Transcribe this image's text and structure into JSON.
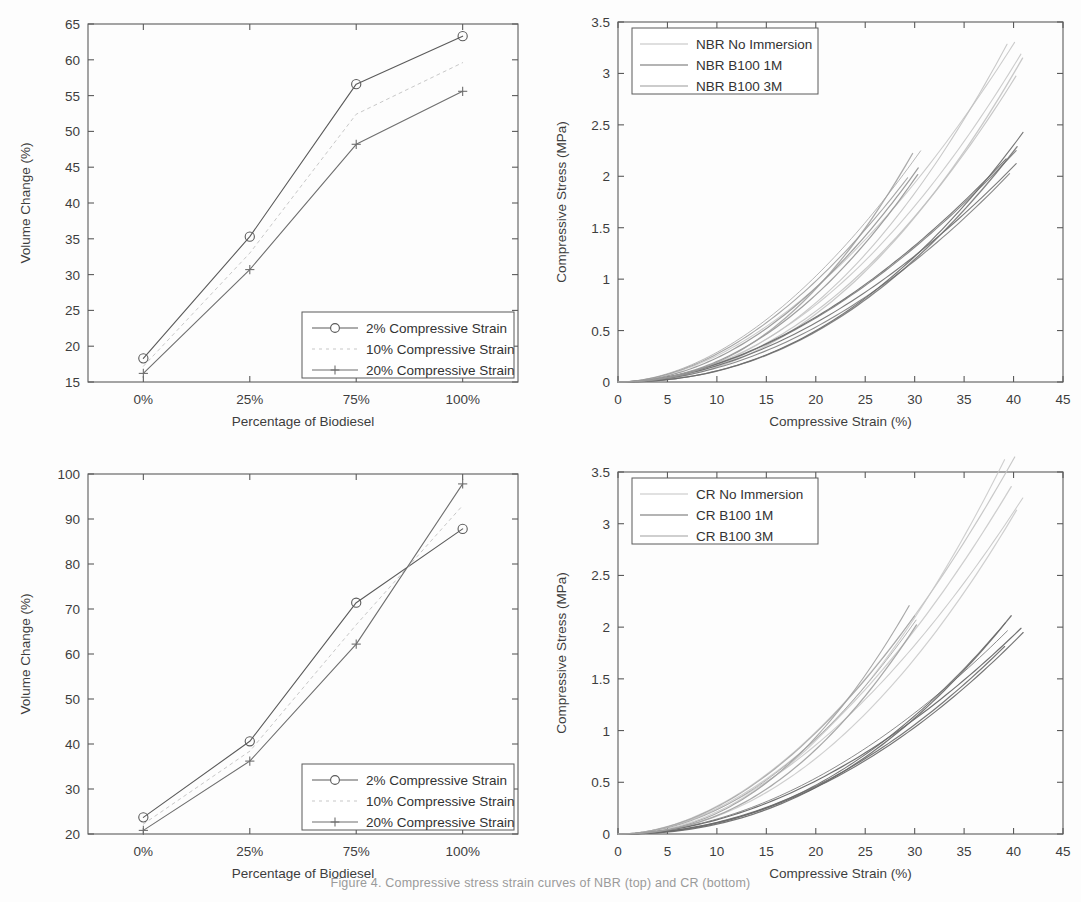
{
  "figure": {
    "caption_fragment": "Figure 4. Compressive stress strain curves of NBR (top) and CR (bottom)"
  },
  "chart_data": [
    {
      "panel": "top-left",
      "type": "line",
      "title": "",
      "xlabel": "Percentage of Biodiesel",
      "ylabel": "Volume Change (%)",
      "categories": [
        "0%",
        "25%",
        "75%",
        "100%"
      ],
      "xlim": [
        -0.35,
        3.35
      ],
      "ylim": [
        15,
        65
      ],
      "yticks": [
        15,
        20,
        25,
        30,
        35,
        40,
        45,
        50,
        55,
        60,
        65
      ],
      "grid": false,
      "legend_position": "lower-right",
      "series": [
        {
          "name": "2% Compressive Strain",
          "marker": "circle",
          "color": "#5a5a5a",
          "values": [
            18.3,
            35.3,
            56.6,
            63.3
          ]
        },
        {
          "name": "10% Compressive Strain",
          "marker": "none",
          "color": "#c8c8c8",
          "values": [
            17.2,
            33.0,
            52.4,
            59.6
          ]
        },
        {
          "name": "20% Compressive Strain",
          "marker": "plus",
          "color": "#6e6e6e",
          "values": [
            16.2,
            30.7,
            48.2,
            55.6
          ]
        }
      ]
    },
    {
      "panel": "top-right",
      "type": "line",
      "title": "",
      "xlabel": "Compressive Strain (%)",
      "ylabel": "Compressive Stress (MPa)",
      "xlim": [
        0,
        45
      ],
      "ylim": [
        0,
        3.5
      ],
      "xticks": [
        0,
        5,
        10,
        15,
        20,
        25,
        30,
        35,
        40,
        45
      ],
      "yticks": [
        0,
        0.5,
        1,
        1.5,
        2,
        2.5,
        3,
        3.5
      ],
      "grid": false,
      "legend_position": "upper-left",
      "series": [
        {
          "name": "NBR No Immersion",
          "color": "#c0c0c0",
          "peak_strain": 40,
          "peak_stress": 3.2,
          "count": 5
        },
        {
          "name": "NBR B100 1M",
          "color": "#6a6a6a",
          "peak_strain": 40,
          "peak_stress": 2.25,
          "count": 6
        },
        {
          "name": "NBR B100 3M",
          "color": "#9a9a9a",
          "peak_strain": 30,
          "peak_stress": 2.05,
          "count": 5
        }
      ]
    },
    {
      "panel": "bottom-left",
      "type": "line",
      "title": "",
      "xlabel": "Percentage of Biodiesel",
      "ylabel": "Volume Change (%)",
      "categories": [
        "0%",
        "25%",
        "75%",
        "100%"
      ],
      "xlim": [
        -0.35,
        3.35
      ],
      "ylim": [
        20,
        100
      ],
      "yticks": [
        20,
        30,
        40,
        50,
        60,
        70,
        80,
        90,
        100
      ],
      "grid": false,
      "legend_position": "lower-right",
      "series": [
        {
          "name": "2% Compressive Strain",
          "marker": "circle",
          "color": "#5a5a5a",
          "values": [
            23.7,
            40.6,
            71.4,
            87.8
          ]
        },
        {
          "name": "10% Compressive Strain",
          "marker": "none",
          "color": "#c8c8c8",
          "values": [
            22.2,
            38.4,
            66.5,
            93.0
          ]
        },
        {
          "name": "20% Compressive Strain",
          "marker": "plus",
          "color": "#6e6e6e",
          "values": [
            20.8,
            36.2,
            62.2,
            97.8
          ]
        }
      ]
    },
    {
      "panel": "bottom-right",
      "type": "line",
      "title": "",
      "xlabel": "Compressive Strain (%)",
      "ylabel": "Compressive Stress (MPa)",
      "xlim": [
        0,
        45
      ],
      "ylim": [
        0,
        3.5
      ],
      "xticks": [
        0,
        5,
        10,
        15,
        20,
        25,
        30,
        35,
        40,
        45
      ],
      "yticks": [
        0,
        0.5,
        1,
        1.5,
        2,
        2.5,
        3,
        3.5
      ],
      "grid": false,
      "legend_position": "upper-left",
      "series": [
        {
          "name": "CR No Immersion",
          "color": "#c4c4c4",
          "peak_strain": 40,
          "peak_stress": 3.4,
          "count": 5
        },
        {
          "name": "CR B100 1M",
          "color": "#6a6a6a",
          "peak_strain": 40,
          "peak_stress": 2.0,
          "count": 6
        },
        {
          "name": "CR B100 3M",
          "color": "#a0a0a0",
          "peak_strain": 30,
          "peak_stress": 2.2,
          "count": 4
        }
      ]
    }
  ],
  "panels": {
    "top_left": {
      "ylabel": "Volume Change (%)",
      "xlabel": "Percentage of Biodiesel",
      "yticks": [
        "65",
        "60",
        "55",
        "50",
        "45",
        "40",
        "35",
        "30",
        "25",
        "20",
        "15"
      ],
      "xticks": [
        "0%",
        "25%",
        "75%",
        "100%"
      ],
      "legend": [
        "2% Compressive Strain",
        "10% Compressive Strain",
        "20% Compressive Strain"
      ]
    },
    "top_right": {
      "ylabel": "Compressive Stress (MPa)",
      "xlabel": "Compressive Strain (%)",
      "yticks": [
        "3.5",
        "3",
        "2.5",
        "2",
        "1.5",
        "1",
        "0.5",
        "0"
      ],
      "xticks": [
        "0",
        "5",
        "10",
        "15",
        "20",
        "25",
        "30",
        "35",
        "40",
        "45"
      ],
      "legend": [
        "NBR No Immersion",
        "NBR B100 1M",
        "NBR B100 3M"
      ]
    },
    "bottom_left": {
      "ylabel": "Volume Change (%)",
      "xlabel": "Percentage of Biodiesel",
      "yticks": [
        "100",
        "90",
        "80",
        "70",
        "60",
        "50",
        "40",
        "30",
        "20"
      ],
      "xticks": [
        "0%",
        "25%",
        "75%",
        "100%"
      ],
      "legend": [
        "2% Compressive Strain",
        "10% Compressive Strain",
        "20% Compressive Strain"
      ]
    },
    "bottom_right": {
      "ylabel": "Compressive Stress (MPa)",
      "xlabel": "Compressive Strain (%)",
      "yticks": [
        "3.5",
        "3",
        "2.5",
        "2",
        "1.5",
        "1",
        "0.5",
        "0"
      ],
      "xticks": [
        "0",
        "5",
        "10",
        "15",
        "20",
        "25",
        "30",
        "35",
        "40",
        "45"
      ],
      "legend": [
        "CR No Immersion",
        "CR B100 1M",
        "CR B100 3M"
      ]
    }
  }
}
